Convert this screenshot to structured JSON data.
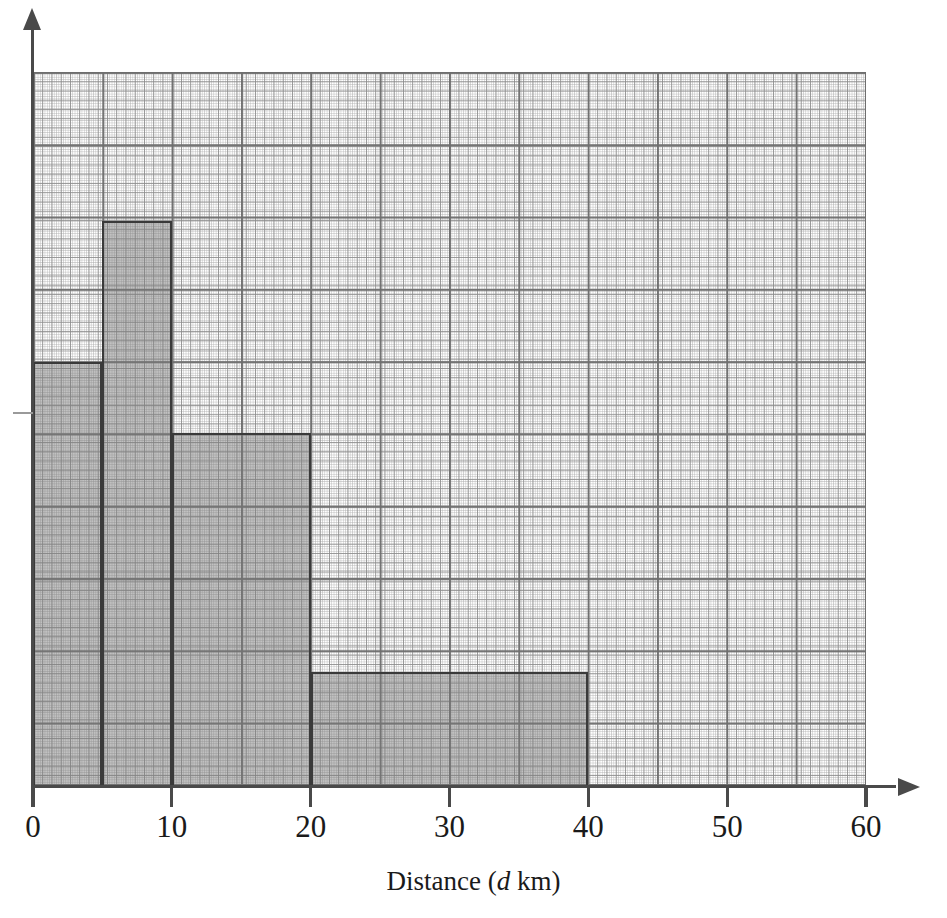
{
  "figure": {
    "kind": "histogram",
    "background": "#ffffff",
    "bar_fill_color": "#a8a8a8",
    "bar_edge_color": "#3a3a3a",
    "axis_color": "#4a4a4a",
    "grid_major_color": "#6e6e6e",
    "grid_medium_color": "#8c8c8c",
    "grid_fine_color": "#afafaf"
  },
  "axes": {
    "x": {
      "title_prefix": "Distance (",
      "title_variable": "d",
      "title_suffix": " km)",
      "title_full": "Distance (d km)",
      "tick_labels": [
        "0",
        "10",
        "20",
        "30",
        "40",
        "50",
        "60"
      ],
      "tick_values": [
        0,
        10,
        20,
        30,
        40,
        50,
        60
      ],
      "range": [
        0,
        60
      ],
      "has_arrow": true
    },
    "y": {
      "title": "",
      "tick_labels": [],
      "has_arrow": true,
      "has_single_unlabelled_tick": true
    },
    "grid": "on"
  },
  "chart_data": {
    "type": "bar",
    "title": "",
    "xlabel": "Distance (d km)",
    "ylabel": "",
    "xlim": [
      0,
      60
    ],
    "ylim": [
      0,
      5
    ],
    "grid": true,
    "legend": "none",
    "categories": [
      "0 < d ≤ 5",
      "5 < d ≤ 10",
      "10 < d ≤ 20",
      "20 < d ≤ 40"
    ],
    "bin_edges": [
      0,
      5,
      10,
      20,
      40
    ],
    "values": [
      3.0,
      4.0,
      2.5,
      0.8
    ],
    "value_label": "frequency density",
    "bars": [
      {
        "label": "0 < d ≤ 5",
        "x_start": 0,
        "x_end": 5,
        "height": 3.0
      },
      {
        "label": "5 < d ≤ 10",
        "x_start": 5,
        "x_end": 10,
        "height": 4.0
      },
      {
        "label": "10 < d ≤ 20",
        "x_start": 10,
        "x_end": 20,
        "height": 2.5
      },
      {
        "label": "20 < d ≤ 40",
        "x_start": 20,
        "x_end": 40,
        "height": 0.8
      }
    ],
    "annotations": []
  },
  "geometry": {
    "plot_left": 33,
    "plot_right": 866,
    "plot_top": 72,
    "plot_bottom": 785,
    "px_per_x_unit": 13.8833,
    "px_per_y_unit": 141.0
  }
}
